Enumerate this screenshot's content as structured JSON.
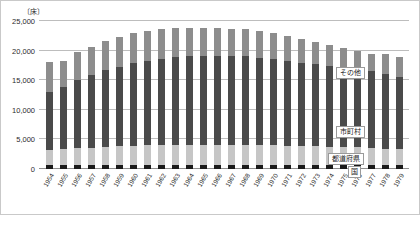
{
  "chart_data": {
    "type": "bar",
    "title": "",
    "subtitle": "",
    "unit_label": "〔床〕",
    "xlabel": "",
    "ylabel": "",
    "ylim": [
      0,
      25000
    ],
    "yticks": [
      25000,
      20000,
      15000,
      10000,
      5000
    ],
    "ytick_labels": [
      "25,000",
      "20,000",
      "15,000",
      "10,000",
      "5,000"
    ],
    "grid": true,
    "stacked": true,
    "legend_position": "inside-right",
    "categories": [
      "1954",
      "1955",
      "1956",
      "1957",
      "1958",
      "1959",
      "1960",
      "1961",
      "1962",
      "1963",
      "1964",
      "1965",
      "1966",
      "1967",
      "1968",
      "1969",
      "1970",
      "1971",
      "1972",
      "1973",
      "1974",
      "1975",
      "1976",
      "1977",
      "1978",
      "1979"
    ],
    "series": [
      {
        "name": "国",
        "color": "#1a1a1a",
        "values": [
          620,
          640,
          660,
          680,
          700,
          700,
          710,
          710,
          720,
          720,
          720,
          720,
          720,
          720,
          720,
          710,
          700,
          700,
          690,
          680,
          670,
          660,
          650,
          640,
          630,
          620
        ]
      },
      {
        "name": "都道府県",
        "color": "#c6c6c6",
        "values": [
          2600,
          2700,
          2850,
          2950,
          3050,
          3150,
          3250,
          3300,
          3350,
          3400,
          3400,
          3400,
          3400,
          3400,
          3400,
          3350,
          3300,
          3250,
          3200,
          3150,
          3100,
          3050,
          3000,
          2950,
          2800,
          2700
        ]
      },
      {
        "name": "市町村",
        "color": "#4a4a4a",
        "values": [
          9800,
          10600,
          11500,
          12300,
          12900,
          13400,
          13900,
          14300,
          14600,
          14800,
          14900,
          15000,
          15000,
          14950,
          14900,
          14750,
          14550,
          14350,
          14100,
          13850,
          13600,
          13400,
          13200,
          13000,
          12600,
          12300
        ]
      },
      {
        "name": "その他",
        "color": "#8d8d8d",
        "values": [
          4980,
          4260,
          4690,
          4670,
          4950,
          5050,
          5040,
          5090,
          4930,
          4880,
          4880,
          4780,
          4680,
          4630,
          4580,
          4490,
          4350,
          4200,
          4010,
          3820,
          3630,
          3390,
          3150,
          2910,
          3470,
          3380
        ]
      }
    ],
    "totals": [
      18000,
      18200,
      19700,
      20600,
      21600,
      22300,
      22900,
      23400,
      23600,
      23800,
      23900,
      23900,
      23800,
      23700,
      23600,
      23300,
      22900,
      22500,
      22000,
      21500,
      21000,
      20500,
      20000,
      19500,
      19500,
      19000
    ]
  },
  "legend": {
    "other": "その他",
    "municipality": "市町村",
    "prefecture": "都道府県",
    "national": "国"
  }
}
